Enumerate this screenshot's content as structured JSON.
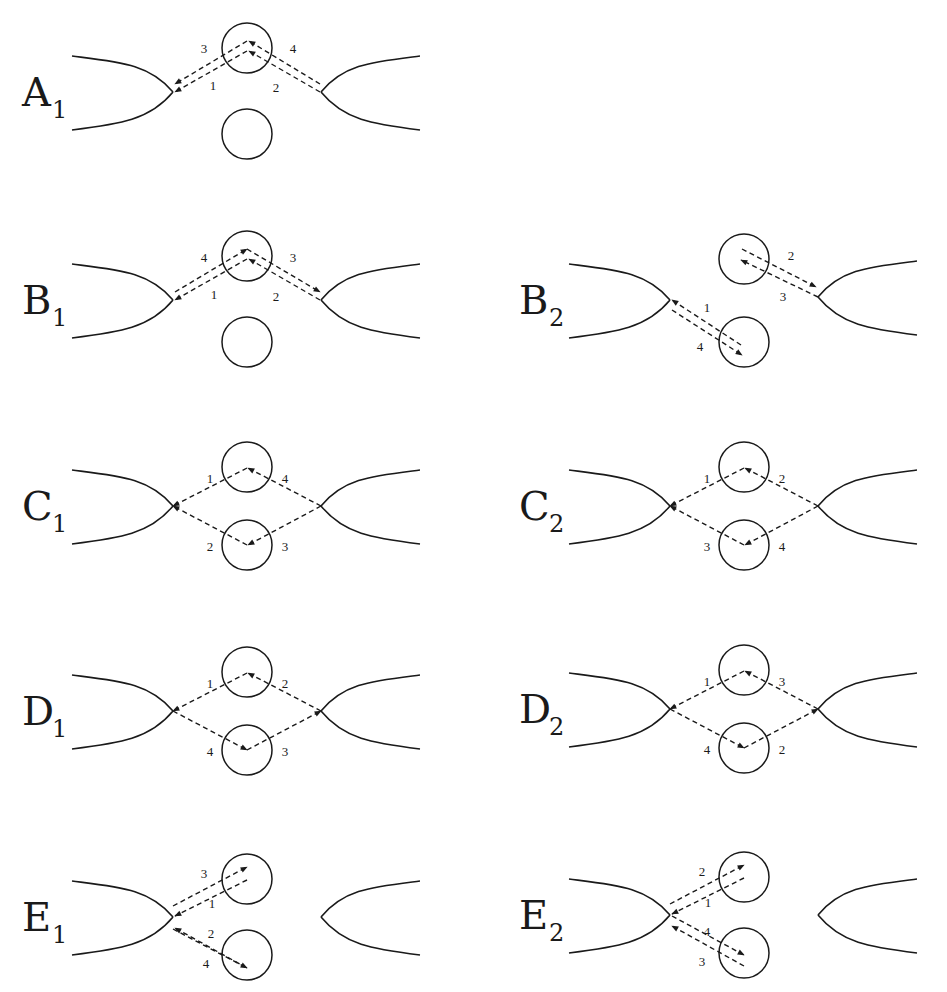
{
  "figure": {
    "stroke_color": "#1a1a1a",
    "background": "#ffffff"
  },
  "panels": [
    {
      "id": "A1",
      "letter": "A",
      "subscript": "1",
      "layout": "single-upper",
      "segments": [
        {
          "num": "1",
          "from": "upper",
          "to": "left"
        },
        {
          "num": "2",
          "from": "right",
          "to": "upper"
        },
        {
          "num": "3",
          "from": "upper",
          "to": "left"
        },
        {
          "num": "4",
          "from": "right",
          "to": "upper"
        }
      ]
    },
    {
      "id": "B1",
      "letter": "B",
      "subscript": "1",
      "layout": "single-upper",
      "segments": [
        {
          "num": "1",
          "from": "upper",
          "to": "left"
        },
        {
          "num": "2",
          "from": "right",
          "to": "upper"
        },
        {
          "num": "3",
          "from": "upper",
          "to": "right"
        },
        {
          "num": "4",
          "from": "left",
          "to": "upper"
        }
      ]
    },
    {
      "id": "B2",
      "letter": "B",
      "subscript": "2",
      "layout": "split",
      "segments": [
        {
          "num": "1",
          "from": "lower",
          "to": "left"
        },
        {
          "num": "2",
          "from": "upper",
          "to": "right"
        },
        {
          "num": "3",
          "from": "right",
          "to": "upper"
        },
        {
          "num": "4",
          "from": "left",
          "to": "lower"
        }
      ]
    },
    {
      "id": "C1",
      "letter": "C",
      "subscript": "1",
      "layout": "diamond",
      "segments": [
        {
          "num": "1",
          "from": "upper",
          "to": "left"
        },
        {
          "num": "2",
          "from": "lower",
          "to": "left"
        },
        {
          "num": "3",
          "from": "right",
          "to": "lower"
        },
        {
          "num": "4",
          "from": "right",
          "to": "upper"
        }
      ]
    },
    {
      "id": "C2",
      "letter": "C",
      "subscript": "2",
      "layout": "diamond",
      "segments": [
        {
          "num": "1",
          "from": "upper",
          "to": "left"
        },
        {
          "num": "2",
          "from": "right",
          "to": "upper"
        },
        {
          "num": "3",
          "from": "lower",
          "to": "left"
        },
        {
          "num": "4",
          "from": "right",
          "to": "lower"
        }
      ]
    },
    {
      "id": "D1",
      "letter": "D",
      "subscript": "1",
      "layout": "diamond",
      "segments": [
        {
          "num": "1",
          "from": "upper",
          "to": "left"
        },
        {
          "num": "2",
          "from": "right",
          "to": "upper"
        },
        {
          "num": "3",
          "from": "lower",
          "to": "right"
        },
        {
          "num": "4",
          "from": "left",
          "to": "lower"
        }
      ]
    },
    {
      "id": "D2",
      "letter": "D",
      "subscript": "2",
      "layout": "diamond",
      "segments": [
        {
          "num": "1",
          "from": "upper",
          "to": "left"
        },
        {
          "num": "2",
          "from": "lower",
          "to": "right"
        },
        {
          "num": "3",
          "from": "right",
          "to": "upper"
        },
        {
          "num": "4",
          "from": "left",
          "to": "lower"
        }
      ]
    },
    {
      "id": "E1",
      "letter": "E",
      "subscript": "1",
      "layout": "fan-left",
      "segments": [
        {
          "num": "1",
          "from": "upper",
          "to": "left"
        },
        {
          "num": "2",
          "from": "lower",
          "to": "left"
        },
        {
          "num": "3",
          "from": "left",
          "to": "upper"
        },
        {
          "num": "4",
          "from": "left",
          "to": "lower"
        }
      ]
    },
    {
      "id": "E2",
      "letter": "E",
      "subscript": "2",
      "layout": "fan-left",
      "segments": [
        {
          "num": "1",
          "from": "upper",
          "to": "left"
        },
        {
          "num": "2",
          "from": "left",
          "to": "upper"
        },
        {
          "num": "3",
          "from": "lower",
          "to": "left"
        },
        {
          "num": "4",
          "from": "left",
          "to": "lower"
        }
      ]
    }
  ]
}
